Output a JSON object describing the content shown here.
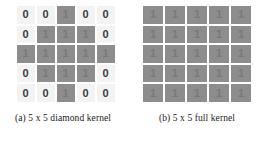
{
  "figure": {
    "subfigures": [
      {
        "id": "diamond-kernel",
        "caption": "(a) 5 x 5 diamond kernel",
        "grid": {
          "rows": 5,
          "cols": 5,
          "values": [
            [
              0,
              0,
              1,
              0,
              0
            ],
            [
              0,
              1,
              1,
              1,
              0
            ],
            [
              1,
              1,
              1,
              1,
              1
            ],
            [
              0,
              1,
              1,
              1,
              0
            ],
            [
              0,
              0,
              1,
              0,
              0
            ]
          ]
        }
      },
      {
        "id": "full-kernel",
        "caption": "(b) 5 x 5 full kernel",
        "grid": {
          "rows": 5,
          "cols": 5,
          "values": [
            [
              1,
              1,
              1,
              1,
              1
            ],
            [
              1,
              1,
              1,
              1,
              1
            ],
            [
              1,
              1,
              1,
              1,
              1
            ],
            [
              1,
              1,
              1,
              1,
              1
            ],
            [
              1,
              1,
              1,
              1,
              1
            ]
          ]
        }
      }
    ]
  },
  "colors": {
    "background": "#ffffff",
    "cell_off": "#f3f3f3",
    "cell_on": "#8d8d8d",
    "text_off": "#3a3a3a",
    "text_on": "#7a7a7a",
    "caption": "#1a1a1a"
  }
}
